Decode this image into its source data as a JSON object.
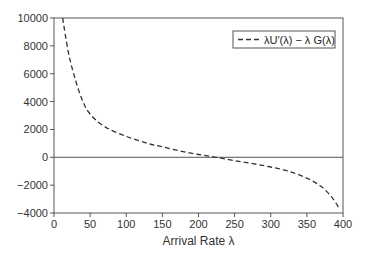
{
  "chart_data": {
    "type": "line",
    "title": "",
    "xlabel": "Arrival Rate λ",
    "ylabel": "",
    "xlim": [
      0,
      400
    ],
    "ylim": [
      -4000,
      10000
    ],
    "xticks": [
      0,
      50,
      100,
      150,
      200,
      250,
      300,
      350,
      400
    ],
    "yticks": [
      -4000,
      -2000,
      0,
      2000,
      4000,
      6000,
      8000,
      10000
    ],
    "xtick_labels": [
      "0",
      "50",
      "100",
      "150",
      "200",
      "250",
      "300",
      "350",
      "400"
    ],
    "ytick_labels": [
      "−4000",
      "−2000",
      "0",
      "2000",
      "4000",
      "6000",
      "8000",
      "10000"
    ],
    "grid": false,
    "legend_position": "upper right",
    "reference_lines": [
      {
        "axis": "y",
        "value": 0
      }
    ],
    "series": [
      {
        "name": "λU′(λ) − λ G(λ)",
        "style": "dashed",
        "color": "#333333",
        "x": [
          12,
          20,
          30,
          40,
          50,
          70,
          100,
          130,
          150,
          175,
          200,
          225,
          250,
          275,
          300,
          325,
          350,
          370,
          385,
          395
        ],
        "values": [
          10000,
          7500,
          5500,
          4000,
          3100,
          2200,
          1500,
          1000,
          750,
          450,
          200,
          0,
          -250,
          -450,
          -700,
          -1000,
          -1500,
          -2100,
          -2900,
          -3700
        ]
      }
    ]
  }
}
